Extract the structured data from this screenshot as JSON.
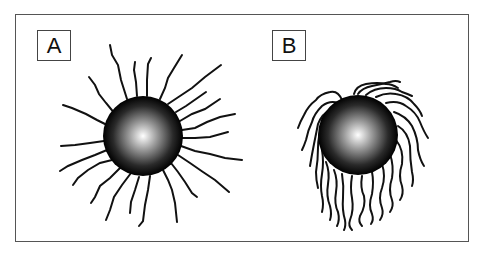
{
  "figure": {
    "panels": [
      {
        "id": "A",
        "label": "A",
        "description": "Sphere with extended, radially outward chains (brush conformation)"
      },
      {
        "id": "B",
        "label": "B",
        "description": "Sphere with collapsed, drooping wavy chains"
      }
    ],
    "colors": {
      "frame": "#555555",
      "chains": "#111111",
      "sphere_center": "#ffffff",
      "sphere_edge": "#000000",
      "background": "#ffffff"
    }
  }
}
